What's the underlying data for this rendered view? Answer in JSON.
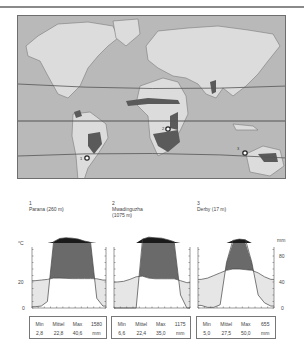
{
  "map": {
    "description": "World map with tropic lines and dry savanna regions shaded; three climate stations marked",
    "station_markers": [
      {
        "number": "1"
      },
      {
        "number": "2"
      },
      {
        "number": "3"
      }
    ]
  },
  "stations": [
    {
      "number": "1",
      "name": "Parana (260 m)",
      "name_line2": ""
    },
    {
      "number": "2",
      "name": "Mwadinguzha",
      "name_line2": "(1075 m)"
    },
    {
      "number": "3",
      "name": "Derby (17 m)",
      "name_line2": ""
    }
  ],
  "axes": {
    "left_unit": "°C",
    "left_ticks": [
      "20",
      "0"
    ],
    "right_unit": "mm",
    "right_ticks": [
      "80",
      "40",
      "0"
    ]
  },
  "tables": [
    {
      "headers": [
        "Min",
        "Mittel",
        "Max",
        "1580"
      ],
      "values": [
        "2,8",
        "22,8",
        "40,6",
        "mm"
      ]
    },
    {
      "headers": [
        "Min",
        "Mittel",
        "Max",
        "1175"
      ],
      "values": [
        "6,6",
        "22,4",
        "35,0",
        "mm"
      ]
    },
    {
      "headers": [
        "Min",
        "Mittel",
        "Max",
        "655"
      ],
      "values": [
        "5,0",
        "27,5",
        "50,0",
        "mm"
      ]
    }
  ],
  "chart_data": [
    {
      "type": "area",
      "title": "Parana (260 m)",
      "x": [
        1,
        2,
        3,
        4,
        5,
        6,
        7,
        8,
        9,
        10,
        11,
        12
      ],
      "series": [
        {
          "name": "Temperatur °C",
          "values": [
            21,
            21.5,
            22,
            23,
            23,
            22.8,
            22.6,
            22.6,
            22.6,
            22.6,
            22.5,
            21.5
          ]
        },
        {
          "name": "Niederschlag mm",
          "values": [
            2,
            3,
            10,
            120,
            170,
            180,
            175,
            160,
            130,
            110,
            15,
            3
          ]
        }
      ],
      "ylim_temp": [
        0,
        50
      ],
      "ylim_precip": [
        0,
        100
      ]
    },
    {
      "type": "area",
      "title": "Mwadinguzha (1075 m)",
      "x": [
        1,
        2,
        3,
        4,
        5,
        6,
        7,
        8,
        9,
        10,
        11,
        12
      ],
      "series": [
        {
          "name": "Temperatur °C",
          "values": [
            20,
            20.5,
            22,
            24,
            24.5,
            23,
            22.5,
            22.5,
            22.5,
            22.5,
            21,
            19.5
          ]
        },
        {
          "name": "Niederschlag mm",
          "values": [
            0,
            0,
            0,
            0,
            160,
            190,
            180,
            175,
            150,
            120,
            20,
            0
          ]
        }
      ],
      "ylim_temp": [
        0,
        50
      ],
      "ylim_precip": [
        0,
        100
      ]
    },
    {
      "type": "area",
      "title": "Derby (17 m)",
      "x": [
        1,
        2,
        3,
        4,
        5,
        6,
        7,
        8,
        9,
        10,
        11,
        12
      ],
      "series": [
        {
          "name": "Temperatur °C",
          "values": [
            22,
            23,
            25,
            27,
            29,
            30,
            30,
            29.5,
            29,
            27,
            24,
            22
          ]
        },
        {
          "name": "Niederschlag mm",
          "values": [
            4,
            1,
            1,
            5,
            70,
            140,
            160,
            150,
            70,
            20,
            8,
            3
          ]
        }
      ],
      "ylim_temp": [
        0,
        50
      ],
      "ylim_precip": [
        0,
        100
      ]
    }
  ]
}
